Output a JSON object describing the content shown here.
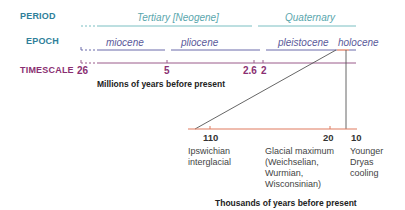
{
  "rows": {
    "period_label": "PERIOD",
    "epoch_label": "EPOCH",
    "timescale_label": "TIMESCALE"
  },
  "periods": [
    {
      "label": "Tertiary [Neogene]"
    },
    {
      "label": "Quaternary"
    }
  ],
  "epochs": [
    {
      "label": "miocene"
    },
    {
      "label": "pliocene"
    },
    {
      "label": "pleistocene"
    },
    {
      "label": "holocene"
    }
  ],
  "timescale": {
    "ticks": [
      "26",
      "5",
      "2.6",
      "2"
    ],
    "axis_title": "Millions of years before present"
  },
  "detail": {
    "ticks": [
      "110",
      "20",
      "10"
    ],
    "axis_title": "Thousands of years before present",
    "events": [
      {
        "label": "Ipswichian interglacial"
      },
      {
        "label": "Glacial maximum (Weichselian, Wurmian, Wisconsinian)"
      },
      {
        "label": "Younger Dryas cooling"
      }
    ]
  },
  "colors": {
    "period_line": "#7bbfc2",
    "epoch_line": "#6a6aaa",
    "timescale_line": "#9a5a8a",
    "detail_line": "#e07a5f",
    "connector": "#555555"
  }
}
